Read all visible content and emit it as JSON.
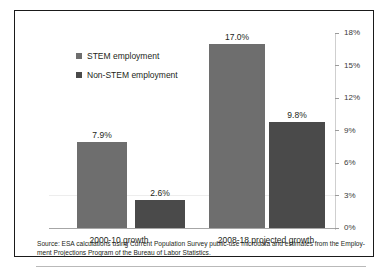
{
  "chart_data": {
    "type": "bar",
    "title": "",
    "xlabel": "",
    "ylabel": "",
    "ylim": [
      0,
      18
    ],
    "ytick_labels": [
      "0%",
      "3%",
      "6%",
      "9%",
      "12%",
      "15%",
      "18%"
    ],
    "ytick_values": [
      0,
      3,
      6,
      9,
      12,
      15,
      18
    ],
    "grid": false,
    "y_axis_position": "right",
    "legend_position": "top-left-inside",
    "categories": [
      "2000-10 growth",
      "2008-18 projected growth"
    ],
    "series": [
      {
        "name": "STEM employment",
        "color": "#6E6E6E",
        "values": [
          7.9,
          17.0
        ],
        "labels": [
          "7.9%",
          "17.0%"
        ]
      },
      {
        "name": "Non-STEM employment",
        "color": "#4A4A4A",
        "values": [
          2.6,
          9.8
        ],
        "labels": [
          "2.6%",
          "9.8%"
        ]
      }
    ],
    "source_note": "Source:  ESA calculations using Current Population Survey public-use microdata and  estimates from the Employ-ment Projections Program of the Bureau of Labor Statistics."
  }
}
